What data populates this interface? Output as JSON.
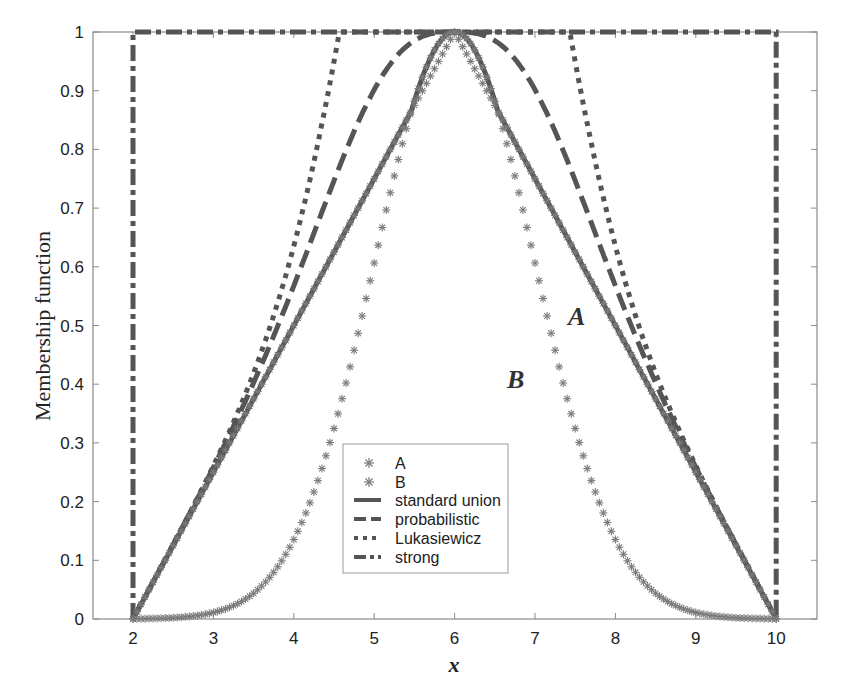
{
  "chart_data": {
    "type": "line",
    "title": "",
    "xlabel": "x",
    "ylabel": "Membership function",
    "xlim": [
      1.5,
      10.5
    ],
    "ylim": [
      0,
      1
    ],
    "xticks": [
      2,
      3,
      4,
      5,
      6,
      7,
      8,
      9,
      10
    ],
    "yticks": [
      0,
      0.1,
      0.2,
      0.3,
      0.4,
      0.5,
      0.6,
      0.7,
      0.8,
      0.9,
      1
    ],
    "ytick_labels": [
      "0",
      "0.1",
      "0.2",
      "0.3",
      "0.4",
      "0.5",
      "0.6",
      "0.7",
      "0.8",
      "0.9",
      "1"
    ],
    "grid": false,
    "legend_position": "lower center",
    "x": [
      2,
      2.5,
      3,
      3.5,
      4,
      4.5,
      5,
      5.5,
      6,
      6.5,
      7,
      7.5,
      8,
      8.5,
      9,
      9.5,
      10
    ],
    "series": [
      {
        "name": "A",
        "style": "star-markers",
        "values": [
          0,
          0.125,
          0.25,
          0.375,
          0.5,
          0.625,
          0.75,
          0.875,
          1,
          0.875,
          0.75,
          0.625,
          0.5,
          0.375,
          0.25,
          0.125,
          0
        ]
      },
      {
        "name": "B",
        "style": "star-markers",
        "values": [
          0.0003,
          0.0022,
          0.011,
          0.044,
          0.135,
          0.325,
          0.607,
          0.882,
          1,
          0.882,
          0.607,
          0.325,
          0.135,
          0.044,
          0.011,
          0.0022,
          0.0003
        ]
      },
      {
        "name": "standard union",
        "style": "solid",
        "values": [
          0,
          0.125,
          0.25,
          0.375,
          0.5,
          0.625,
          0.75,
          0.882,
          1,
          0.882,
          0.75,
          0.625,
          0.5,
          0.375,
          0.25,
          0.125,
          0
        ]
      },
      {
        "name": "probabilistic",
        "style": "dashed",
        "values": [
          0,
          0.127,
          0.258,
          0.403,
          0.568,
          0.747,
          0.902,
          0.985,
          1,
          0.985,
          0.902,
          0.747,
          0.568,
          0.403,
          0.258,
          0.127,
          0
        ]
      },
      {
        "name": "Lukasiewicz",
        "style": "dotted",
        "values": [
          0,
          0.127,
          0.261,
          0.419,
          0.635,
          0.95,
          1,
          1,
          1,
          1,
          1,
          0.95,
          0.635,
          0.419,
          0.261,
          0.127,
          0
        ]
      },
      {
        "name": "strong",
        "style": "dash-dot",
        "values": [
          0,
          1,
          1,
          1,
          1,
          1,
          1,
          1,
          1,
          1,
          1,
          1,
          1,
          1,
          1,
          1,
          0
        ]
      }
    ],
    "annotations": [
      {
        "text": "A",
        "x": 7.8,
        "y": 0.52
      },
      {
        "text": "B",
        "x": 7.05,
        "y": 0.41
      }
    ]
  },
  "legend": {
    "items": [
      {
        "label": "A"
      },
      {
        "label": "B"
      },
      {
        "label": "standard union"
      },
      {
        "label": "probabilistic"
      },
      {
        "label": "Lukasiewicz"
      },
      {
        "label": "strong"
      }
    ]
  },
  "colors": {
    "curve": "#555555",
    "marker": "#7a7a7a",
    "axis": "#8a8a8a",
    "text": "#222222"
  }
}
